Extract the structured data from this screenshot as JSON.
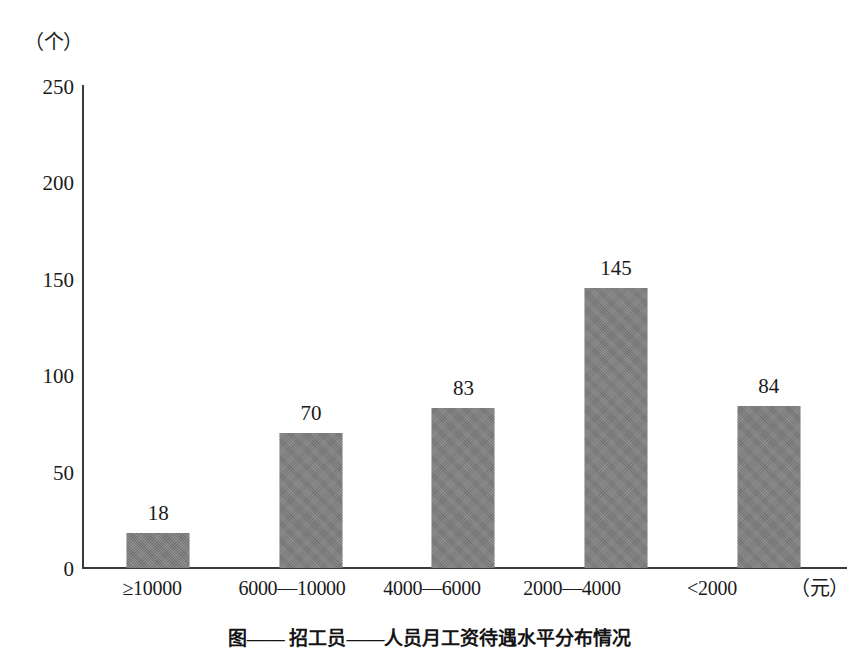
{
  "chart_data": {
    "type": "bar",
    "title": "",
    "categories": [
      "≥10000",
      "6000—10000",
      "4000—6000",
      "2000—4000",
      "<2000"
    ],
    "values": [
      18,
      70,
      83,
      145,
      84
    ],
    "value_labels": [
      "18",
      "70",
      "83",
      "145",
      "84"
    ],
    "xlabel": "（元）",
    "ylabel": "（个）",
    "ylim": [
      0,
      250
    ],
    "yticks": [
      250,
      200,
      150,
      100,
      50,
      0
    ],
    "ytick_labels": [
      "250",
      "200",
      "150",
      "100",
      "50",
      "0"
    ],
    "grid": false,
    "legend": false,
    "bar_color": "#7d7d7d",
    "axis_color": "#3a3a3a",
    "background_color": "#ffffff"
  },
  "figure": {
    "caption": "图——  招工员——人员月工资待遇水平分布情况"
  }
}
